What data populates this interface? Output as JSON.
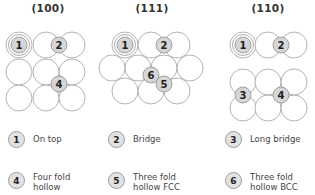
{
  "panels": [
    {
      "id": "100",
      "title": "(100)",
      "title_x": 48
    },
    {
      "id": "111",
      "title": "(111)",
      "title_x": 152
    },
    {
      "id": "110",
      "title": "(110)",
      "title_x": 268
    }
  ],
  "atoms": {
    "radius": 13,
    "stroke": "#aaaaaa",
    "panel_100": [
      [
        19,
        45
      ],
      [
        46,
        45
      ],
      [
        72,
        45
      ],
      [
        19,
        72
      ],
      [
        46,
        72
      ],
      [
        72,
        72
      ],
      [
        19,
        98
      ],
      [
        46,
        98
      ],
      [
        72,
        98
      ]
    ],
    "panel_111": [
      [
        125,
        45
      ],
      [
        151,
        45
      ],
      [
        177,
        45
      ],
      [
        112,
        68
      ],
      [
        138,
        68
      ],
      [
        164,
        68
      ],
      [
        190,
        68
      ],
      [
        125,
        91
      ],
      [
        151,
        91
      ],
      [
        177,
        91
      ]
    ],
    "panel_110": [
      [
        243,
        45
      ],
      [
        268,
        45
      ],
      [
        294,
        45
      ],
      [
        243,
        82
      ],
      [
        268,
        82
      ],
      [
        294,
        82
      ],
      [
        243,
        108
      ],
      [
        268,
        108
      ],
      [
        294,
        108
      ]
    ]
  },
  "sites": [
    {
      "panel": "100",
      "n": "1",
      "x": 19,
      "y": 45,
      "ring": true
    },
    {
      "panel": "100",
      "n": "2",
      "x": 59,
      "y": 45
    },
    {
      "panel": "100",
      "n": "4",
      "x": 59,
      "y": 84
    },
    {
      "panel": "111",
      "n": "1",
      "x": 125,
      "y": 45,
      "ring": true
    },
    {
      "panel": "111",
      "n": "2",
      "x": 164,
      "y": 45
    },
    {
      "panel": "111",
      "n": "6",
      "x": 151,
      "y": 75
    },
    {
      "panel": "111",
      "n": "5",
      "x": 164,
      "y": 84
    },
    {
      "panel": "110",
      "n": "1",
      "x": 243,
      "y": 45,
      "ring": true
    },
    {
      "panel": "110",
      "n": "2",
      "x": 281,
      "y": 45
    },
    {
      "panel": "110",
      "n": "3",
      "x": 243,
      "y": 95
    },
    {
      "panel": "110",
      "n": "4",
      "x": 281,
      "y": 95
    }
  ],
  "site_style": {
    "fill": "#d6d6d6",
    "stroke": "#8f8f8f",
    "radius": 8
  },
  "legend": [
    {
      "n": "1",
      "label": "On top",
      "x": 8,
      "y": 131
    },
    {
      "n": "2",
      "label": "Bridge",
      "x": 108,
      "y": 131
    },
    {
      "n": "3",
      "label": "Long bridge",
      "x": 225,
      "y": 131
    },
    {
      "n": "4",
      "label": "Four fold\nhollow",
      "x": 8,
      "y": 172
    },
    {
      "n": "5",
      "label": "Three fold\nhollow FCC",
      "x": 108,
      "y": 172
    },
    {
      "n": "6",
      "label": "Three fold\nhollow BCC",
      "x": 225,
      "y": 172
    }
  ]
}
